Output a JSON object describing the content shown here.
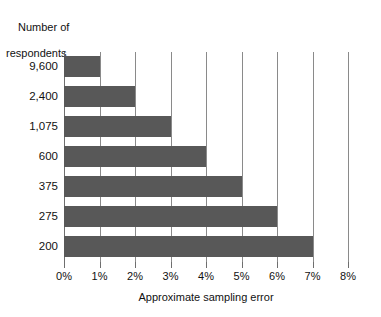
{
  "chart_data": {
    "type": "bar",
    "orientation": "horizontal",
    "title": "",
    "ylabel": "Number of\nrespondents",
    "xlabel": "Approximate sampling error",
    "categories": [
      "9,600",
      "2,400",
      "1,075",
      "600",
      "375",
      "275",
      "200"
    ],
    "values": [
      1,
      2,
      3,
      4,
      5,
      6,
      7
    ],
    "value_unit": "%",
    "xlim": [
      0,
      8
    ],
    "xticks": [
      0,
      1,
      2,
      3,
      4,
      5,
      6,
      7,
      8
    ],
    "xtick_labels": [
      "0%",
      "1%",
      "2%",
      "3%",
      "4%",
      "5%",
      "6%",
      "7%",
      "8%"
    ],
    "grid": "vertical",
    "legend": "none",
    "bar_color": "#585858",
    "gridline_color": "#8a8a8a",
    "background_color": "#ffffff",
    "series": [
      {
        "name": "Approximate sampling error",
        "points": [
          {
            "category": "9,600",
            "value": 1,
            "label": "1%"
          },
          {
            "category": "2,400",
            "value": 2,
            "label": "2%"
          },
          {
            "category": "1,075",
            "value": 3,
            "label": "3%"
          },
          {
            "category": "600",
            "value": 4,
            "label": "4%"
          },
          {
            "category": "375",
            "value": 5,
            "label": "5%"
          },
          {
            "category": "275",
            "value": 6,
            "label": "6%"
          },
          {
            "category": "200",
            "value": 7,
            "label": "7%"
          }
        ]
      }
    ]
  },
  "axis_titles": {
    "y_line1": "Number of",
    "y_line2": "respondents",
    "x": "Approximate sampling error"
  }
}
